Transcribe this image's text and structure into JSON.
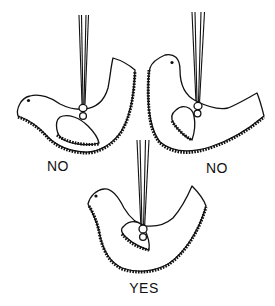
{
  "illustration": {
    "subject": "hanging bird ornaments balance comparison",
    "ink_color": "#111111",
    "background_color": "#ffffff",
    "ornaments": [
      {
        "id": "top-left",
        "label": "NO",
        "verdict": "incorrect",
        "tilt": "tail-up"
      },
      {
        "id": "top-right",
        "label": "NO",
        "verdict": "incorrect",
        "tilt": "head-up"
      },
      {
        "id": "bottom-center",
        "label": "YES",
        "verdict": "correct",
        "tilt": "level"
      }
    ]
  }
}
